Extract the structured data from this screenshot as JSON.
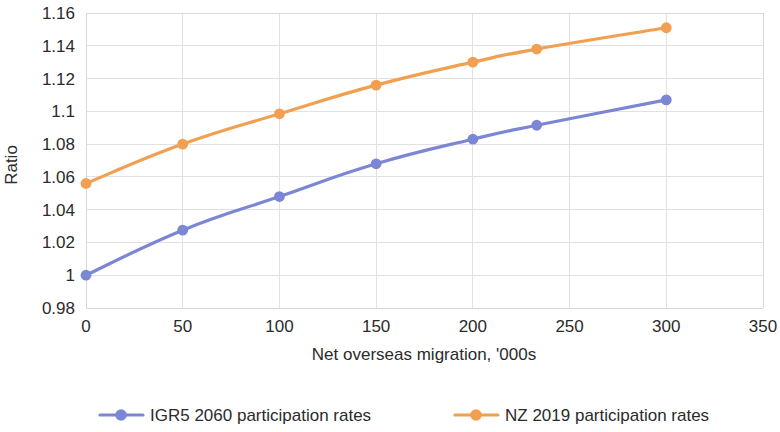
{
  "chart_data": {
    "type": "line",
    "title": "",
    "xlabel": "Net overseas migration, '000s",
    "ylabel": "Ratio",
    "xlim": [
      0,
      350
    ],
    "ylim": [
      0.98,
      1.16
    ],
    "xticks": [
      0,
      50,
      100,
      150,
      200,
      250,
      300,
      350
    ],
    "xtick_labels": [
      "0",
      "50",
      "100",
      "150",
      "200",
      "250",
      "300",
      "350"
    ],
    "yticks": [
      0.98,
      1.0,
      1.02,
      1.04,
      1.06,
      1.08,
      1.1,
      1.12,
      1.14,
      1.16
    ],
    "ytick_labels": [
      "0.98",
      "1",
      "1.02",
      "1.04",
      "1.06",
      "1.08",
      "1.1",
      "1.12",
      "1.14",
      "1.16"
    ],
    "grid": true,
    "legend_position": "bottom",
    "series": [
      {
        "name": "IGR5  2060 participation rates",
        "color": "#7b86d4",
        "marker": "circle",
        "x": [
          0,
          50,
          100,
          150,
          200,
          233,
          300
        ],
        "values": [
          1.0,
          1.0275,
          1.048,
          1.068,
          1.083,
          1.0915,
          1.107
        ]
      },
      {
        "name": "NZ 2019 participation rates",
        "color": "#f0a050",
        "marker": "circle",
        "x": [
          0,
          50,
          100,
          150,
          200,
          233,
          300
        ],
        "values": [
          1.056,
          1.08,
          1.0985,
          1.116,
          1.13,
          1.138,
          1.151
        ]
      }
    ]
  },
  "legend": {
    "items": [
      {
        "label": "IGR5  2060 participation rates",
        "color": "#7b86d4"
      },
      {
        "label": "NZ 2019 participation rates",
        "color": "#f0a050"
      }
    ]
  }
}
